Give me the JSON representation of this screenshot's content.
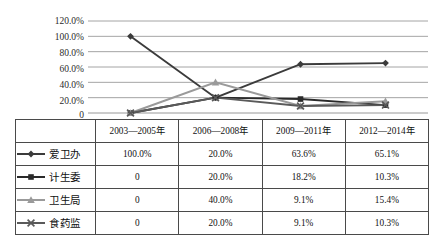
{
  "chart_data": {
    "type": "line",
    "title": "",
    "xlabel": "",
    "ylabel": "",
    "categories": [
      "2003—2005年",
      "2006—2008年",
      "2009—2011年",
      "2012—2014年"
    ],
    "ylim": [
      0,
      120
    ],
    "ytick_labels": [
      "120.0%",
      "100.0%",
      "80.0%",
      "60.0%",
      "40.0%",
      "20.0%",
      "0"
    ],
    "ytick_values": [
      120,
      100,
      80,
      60,
      40,
      20,
      0
    ],
    "grid": true,
    "legend_position": "table-first-column",
    "series": [
      {
        "name": "爱卫办",
        "marker": "diamond",
        "color": "#3b3b3b",
        "values": [
          100.0,
          20.0,
          63.6,
          65.1
        ],
        "labels": [
          "100.0%",
          "20.0%",
          "63.6%",
          "65.1%"
        ]
      },
      {
        "name": "计生委",
        "marker": "square",
        "color": "#2a2a2a",
        "values": [
          0,
          20.0,
          18.2,
          10.3
        ],
        "labels": [
          "0",
          "20.0%",
          "18.2%",
          "10.3%"
        ]
      },
      {
        "name": "卫生局",
        "marker": "triangle",
        "color": "#9a9a9a",
        "values": [
          0,
          40.0,
          9.1,
          15.4
        ],
        "labels": [
          "0",
          "40.0%",
          "9.1%",
          "15.4%"
        ]
      },
      {
        "name": "食药监",
        "marker": "cross",
        "color": "#5a5a5a",
        "values": [
          0,
          20.0,
          9.1,
          10.3
        ],
        "labels": [
          "0",
          "20.0%",
          "9.1%",
          "10.3%"
        ]
      }
    ]
  },
  "table": {
    "corner_label": "",
    "headers": [
      "2003—2005年",
      "2006—2008年",
      "2009—2011年",
      "2012—2014年"
    ],
    "rows": [
      {
        "legend": "爱卫办",
        "cells": [
          "100.0%",
          "20.0%",
          "63.6%",
          "65.1%"
        ]
      },
      {
        "legend": "计生委",
        "cells": [
          "0",
          "20.0%",
          "18.2%",
          "10.3%"
        ]
      },
      {
        "legend": "卫生局",
        "cells": [
          "0",
          "40.0%",
          "9.1%",
          "15.4%"
        ]
      },
      {
        "legend": "食药监",
        "cells": [
          "0",
          "20.0%",
          "9.1%",
          "10.3%"
        ]
      }
    ]
  },
  "axis": {
    "t0": "120.0%",
    "t1": "100.0%",
    "t2": "80.0%",
    "t3": "60.0%",
    "t4": "40.0%",
    "t5": "20.0%",
    "t6": "0"
  }
}
